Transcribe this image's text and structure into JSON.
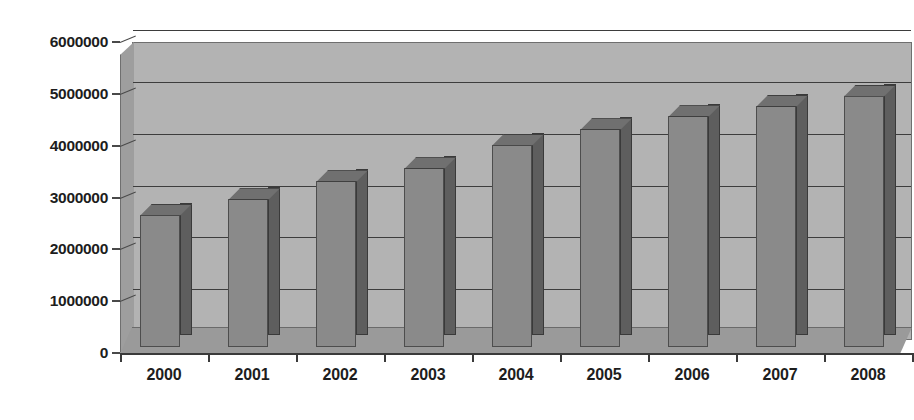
{
  "chart_data": {
    "type": "bar",
    "title": "",
    "title_note": "title is cropped off the top of the screenshot and unreadable",
    "xlabel": "",
    "ylabel": "",
    "categories": [
      "2000",
      "2001",
      "2002",
      "2003",
      "2004",
      "2005",
      "2006",
      "2007",
      "2008"
    ],
    "values": [
      2550000,
      2850000,
      3200000,
      3450000,
      3900000,
      4200000,
      4450000,
      4650000,
      4850000
    ],
    "ylim": [
      0,
      6000000
    ],
    "ytick_labels": [
      "0",
      "1000000",
      "2000000",
      "3000000",
      "4000000",
      "5000000",
      "6000000"
    ],
    "ytick_values": [
      0,
      1000000,
      2000000,
      3000000,
      4000000,
      5000000,
      6000000
    ],
    "grid": true,
    "legend": "none",
    "style": "3d-column",
    "colors": {
      "bar_face": "#8a8a8a",
      "bar_side": "#5e5e5e",
      "bar_top": "#707070",
      "wall": "#b3b3b3",
      "floor": "#9a9a9a",
      "gridline": "#3d3d3d",
      "axis": "#3a3a3a",
      "text": "#1d1d1d",
      "background": "#ffffff"
    }
  }
}
